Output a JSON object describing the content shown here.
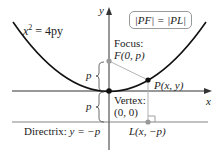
{
  "diagram": {
    "equation": "x² = 4py",
    "equation_base": "x",
    "equation_exp": "2",
    "equation_rest": " = 4py",
    "condition": "|PF| = |PL|",
    "axis_x_label": "x",
    "axis_y_label": "y",
    "focus_title": "Focus:",
    "focus_coords": "F(0, p)",
    "vertex_title": "Vertex:",
    "vertex_coords": "(0, 0)",
    "point_label": "P(x, y)",
    "foot_label": "L(x, −p)",
    "directrix_label": "Directrix: y = −p",
    "directrix_text": "Directrix: ",
    "directrix_eq": "y = −p",
    "p_upper": "p",
    "p_lower": "p",
    "colors": {
      "curve": "#111111",
      "axis": "#333333",
      "gray_point": "#999999",
      "helper_line": "#aaaaaa"
    }
  }
}
